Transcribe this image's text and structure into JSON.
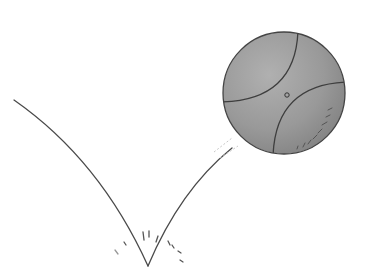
{
  "illustration": {
    "subject": "bouncing ball",
    "description": "Pencil sketch of a gray ball rebounding upward after bouncing, with its trajectory drawn as a V-shaped line and small impact strokes at the bounce point",
    "colors": {
      "background": "#ffffff",
      "ball_fill": "#9a9a9a",
      "ball_shade": "#858585",
      "ball_highlight": "#b4b4b4",
      "line": "#4a4a4a"
    }
  }
}
